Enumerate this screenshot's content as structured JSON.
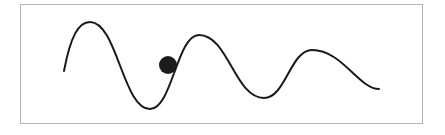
{
  "diagram": {
    "frame": {
      "x": 20,
      "y": 4,
      "width": 403,
      "height": 120,
      "border_color": "#b4b4b4"
    },
    "curve": {
      "color": "#1a1a1a",
      "stroke_width": 2,
      "key_points": [
        {
          "x": 64,
          "y": 71,
          "role": "start"
        },
        {
          "x": 90,
          "y": 22,
          "role": "peak"
        },
        {
          "x": 150,
          "y": 109,
          "role": "trough"
        },
        {
          "x": 199,
          "y": 35,
          "role": "peak"
        },
        {
          "x": 264,
          "y": 98,
          "role": "trough"
        },
        {
          "x": 312,
          "y": 50,
          "role": "peak"
        },
        {
          "x": 379,
          "y": 89,
          "role": "end"
        }
      ]
    },
    "ball": {
      "cx": 168,
      "cy": 65,
      "r": 9,
      "color": "#1c1c1c"
    }
  }
}
